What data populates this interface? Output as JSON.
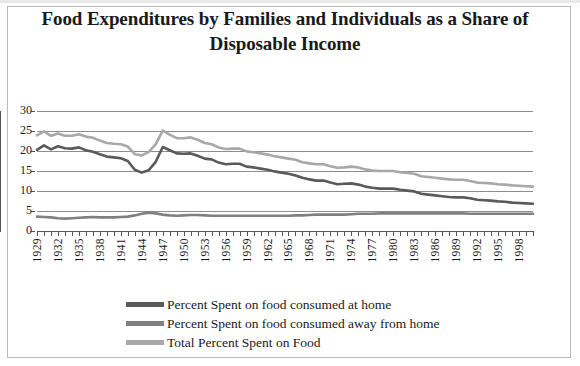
{
  "chart_data": {
    "type": "line",
    "title": "Food Expenditures by Families and Individuals as a Share of Disposable Income",
    "xlabel": "",
    "ylabel": "",
    "ylim": [
      0,
      30
    ],
    "ytick_values": [
      0,
      5,
      10,
      15,
      20,
      25,
      30
    ],
    "ytick_labels": [
      "0",
      "5",
      "10",
      "15",
      "20",
      "25",
      "30"
    ],
    "grid": true,
    "legend_position": "bottom",
    "x": [
      1929,
      1930,
      1931,
      1932,
      1933,
      1934,
      1935,
      1936,
      1937,
      1938,
      1939,
      1940,
      1941,
      1942,
      1943,
      1944,
      1945,
      1946,
      1947,
      1948,
      1949,
      1950,
      1951,
      1952,
      1953,
      1954,
      1955,
      1956,
      1957,
      1958,
      1959,
      1960,
      1961,
      1962,
      1963,
      1964,
      1965,
      1966,
      1967,
      1968,
      1969,
      1970,
      1971,
      1972,
      1973,
      1974,
      1975,
      1976,
      1977,
      1978,
      1979,
      1980,
      1981,
      1982,
      1983,
      1984,
      1985,
      1986,
      1987,
      1988,
      1989,
      1990,
      1991,
      1992,
      1993,
      1994,
      1995,
      1996,
      1997,
      1998,
      1999,
      2000
    ],
    "xtick_labels": [
      "1929",
      "1932",
      "1935",
      "1938",
      "1941",
      "1944",
      "1947",
      "1950",
      "1953",
      "1956",
      "1959",
      "1962",
      "1965",
      "1968",
      "1971",
      "1974",
      "1977",
      "1980",
      "1983",
      "1986",
      "1989",
      "1992",
      "1995",
      "1998"
    ],
    "xtick_step_years": 3,
    "series": [
      {
        "name": "Percent Spent on food consumed at home",
        "color": "#5a5a5a",
        "values": [
          20.3,
          21.4,
          20.4,
          21.2,
          20.7,
          20.6,
          20.9,
          20.2,
          19.8,
          19.2,
          18.6,
          18.4,
          18.2,
          17.5,
          15.3,
          14.6,
          15.2,
          17.3,
          21.0,
          20.2,
          19.4,
          19.3,
          19.4,
          18.8,
          18.1,
          17.9,
          17.1,
          16.7,
          16.8,
          16.8,
          16.1,
          15.9,
          15.6,
          15.3,
          14.9,
          14.6,
          14.3,
          13.9,
          13.3,
          12.9,
          12.6,
          12.6,
          12.1,
          11.7,
          11.8,
          11.9,
          11.6,
          11.1,
          10.8,
          10.6,
          10.6,
          10.6,
          10.3,
          10.1,
          9.9,
          9.3,
          9.1,
          8.9,
          8.7,
          8.5,
          8.4,
          8.4,
          8.2,
          7.8,
          7.7,
          7.6,
          7.4,
          7.3,
          7.1,
          7.0,
          6.9,
          6.8
        ]
      },
      {
        "name": "Percent Spent on food consumed away from home",
        "color": "#808080",
        "values": [
          3.6,
          3.5,
          3.4,
          3.2,
          3.1,
          3.2,
          3.3,
          3.4,
          3.5,
          3.4,
          3.4,
          3.4,
          3.5,
          3.6,
          3.9,
          4.3,
          4.6,
          4.4,
          4.1,
          3.9,
          3.8,
          3.9,
          4.0,
          4.0,
          3.9,
          3.8,
          3.8,
          3.8,
          3.8,
          3.8,
          3.8,
          3.8,
          3.8,
          3.8,
          3.8,
          3.8,
          3.8,
          3.9,
          3.9,
          4.0,
          4.1,
          4.1,
          4.1,
          4.1,
          4.1,
          4.2,
          4.3,
          4.3,
          4.3,
          4.4,
          4.4,
          4.4,
          4.4,
          4.4,
          4.4,
          4.4,
          4.4,
          4.4,
          4.4,
          4.4,
          4.4,
          4.4,
          4.3,
          4.3,
          4.3,
          4.3,
          4.3,
          4.3,
          4.3,
          4.3,
          4.3,
          4.3
        ]
      },
      {
        "name": "Total Percent Spent on Food",
        "color": "#a8a8a8",
        "values": [
          23.9,
          24.9,
          23.8,
          24.4,
          23.8,
          23.8,
          24.2,
          23.6,
          23.3,
          22.6,
          22.0,
          21.8,
          21.7,
          21.1,
          19.2,
          18.9,
          19.8,
          21.7,
          25.1,
          24.1,
          23.2,
          23.2,
          23.4,
          22.8,
          22.0,
          21.7,
          20.9,
          20.5,
          20.6,
          20.6,
          19.9,
          19.7,
          19.4,
          19.1,
          18.7,
          18.4,
          18.1,
          17.8,
          17.2,
          16.9,
          16.7,
          16.7,
          16.2,
          15.8,
          15.9,
          16.1,
          15.9,
          15.4,
          15.1,
          15.0,
          15.0,
          15.0,
          14.7,
          14.5,
          14.3,
          13.7,
          13.5,
          13.3,
          13.1,
          12.9,
          12.8,
          12.8,
          12.5,
          12.1,
          12.0,
          11.9,
          11.7,
          11.6,
          11.4,
          11.3,
          11.2,
          11.1
        ]
      }
    ]
  },
  "legend": {
    "items": [
      {
        "label": "Percent Spent on food consumed at home",
        "color": "#5a5a5a"
      },
      {
        "label": "Percent Spent on food consumed away from home",
        "color": "#808080"
      },
      {
        "label": "Total Percent Spent on Food",
        "color": "#a8a8a8"
      }
    ]
  }
}
